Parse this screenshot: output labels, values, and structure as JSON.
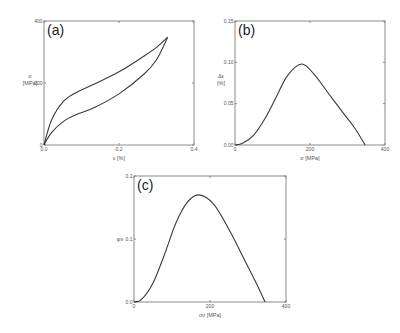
{
  "chart_data": [
    {
      "type": "line",
      "panel_label": "(a)",
      "xlabel": "ε [%]",
      "ylabel_line1": "σ",
      "ylabel_line2": "[MPa]",
      "xlim": [
        0,
        0.4
      ],
      "ylim": [
        0,
        400
      ],
      "xticks": [
        0.0,
        0.2,
        0.4
      ],
      "xtick_labels": [
        "0.0",
        "0.2",
        "0.4"
      ],
      "yticks": [
        0,
        200,
        400
      ],
      "ytick_labels": [
        "0",
        "200",
        "400"
      ],
      "series": [
        {
          "name": "loading",
          "x": [
            0,
            0.02,
            0.053,
            0.09,
            0.133,
            0.2,
            0.267,
            0.3,
            0.33
          ],
          "y": [
            0,
            80,
            142,
            172,
            196,
            236,
            287,
            315,
            348
          ]
        },
        {
          "name": "unloading",
          "x": [
            0,
            0.02,
            0.053,
            0.09,
            0.133,
            0.2,
            0.267,
            0.3,
            0.33
          ],
          "y": [
            0,
            40,
            77,
            100,
            120,
            165,
            229,
            275,
            348
          ]
        }
      ]
    },
    {
      "type": "line",
      "panel_label": "(b)",
      "xlabel": "σ [MPa]",
      "ylabel_line1": "Δε",
      "ylabel_line2": "[%]",
      "xlim": [
        0,
        400
      ],
      "ylim": [
        0,
        0.15
      ],
      "xticks": [
        0,
        200,
        400
      ],
      "xtick_labels": [
        "0",
        "200",
        "400"
      ],
      "yticks": [
        0.0,
        0.05,
        0.1,
        0.15
      ],
      "ytick_labels": [
        "0.00",
        "0.05",
        "0.10",
        "0.15"
      ],
      "series": [
        {
          "name": "delta-strain",
          "x": [
            0,
            20,
            50,
            80,
            110,
            140,
            178,
            210,
            250,
            290,
            320,
            347
          ],
          "y": [
            0,
            0.002,
            0.012,
            0.032,
            0.058,
            0.084,
            0.098,
            0.086,
            0.062,
            0.038,
            0.02,
            0
          ]
        }
      ]
    },
    {
      "type": "line",
      "panel_label": "(c)",
      "xlabel": "σv [MPa]",
      "ylabel_line1": "φv",
      "xlim": [
        0,
        400
      ],
      "ylim": [
        0,
        0.2
      ],
      "xticks": [
        0,
        200,
        400
      ],
      "xtick_labels": [
        "0",
        "200",
        "400"
      ],
      "yticks": [
        0.0,
        0.1,
        0.2
      ],
      "ytick_labels": [
        "0.0",
        "0.1",
        "0.2"
      ],
      "series": [
        {
          "name": "phi-v",
          "x": [
            0,
            20,
            50,
            80,
            110,
            140,
            171,
            210,
            250,
            290,
            320,
            345
          ],
          "y": [
            0,
            0.004,
            0.03,
            0.075,
            0.125,
            0.158,
            0.17,
            0.155,
            0.115,
            0.068,
            0.032,
            0
          ]
        }
      ]
    }
  ]
}
